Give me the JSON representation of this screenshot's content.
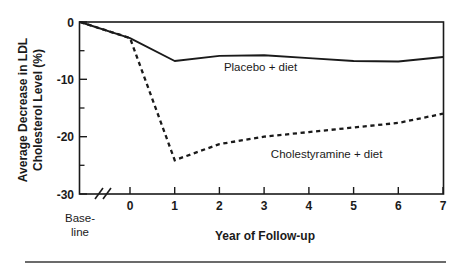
{
  "chart_data": {
    "type": "line",
    "title": "",
    "xlabel": "Year of Follow-up",
    "ylabel": "Average Decrease in LDL Cholesterol Level (%)",
    "ylabel_line1": "Average Decrease in LDL",
    "ylabel_line2": "Cholesterol Level (%)",
    "ylim": [
      -30,
      0
    ],
    "y_ticks": [
      0,
      -10,
      -20,
      -30
    ],
    "y_tick_labels": [
      "0",
      "-10",
      "-20",
      "-30"
    ],
    "y_minor_ticks": [
      -5,
      -15,
      -25
    ],
    "xlim_category": [
      "Baseline",
      0,
      1,
      2,
      3,
      4,
      5,
      6,
      7
    ],
    "x_ticks": [
      0,
      1,
      2,
      3,
      4,
      5,
      6,
      7
    ],
    "x_tick_labels": [
      "0",
      "1",
      "2",
      "3",
      "4",
      "5",
      "6",
      "7"
    ],
    "baseline_tick_label_line1": "Base-",
    "baseline_tick_label_line2": "line",
    "axis_break": true,
    "grid": false,
    "legend": "inline-annotations",
    "series": [
      {
        "name": "Placebo + diet",
        "style": "solid",
        "x": [
          "Baseline",
          0,
          1,
          2,
          3,
          4,
          5,
          6,
          7
        ],
        "values": [
          0,
          -2.8,
          -6.8,
          -5.9,
          -5.8,
          -6.3,
          -6.8,
          -6.9,
          -6.1
        ],
        "label": "Placebo + diet",
        "label_x": 2.1,
        "label_y": -8.5
      },
      {
        "name": "Cholestyramine + diet",
        "style": "dashed",
        "x": [
          "Baseline",
          0,
          1,
          2,
          3,
          4,
          5,
          6,
          7
        ],
        "values": [
          0,
          -2.8,
          -24.1,
          -21.3,
          -20.0,
          -19.2,
          -18.4,
          -17.6,
          -16.0
        ],
        "label": "Cholestyramine + diet",
        "label_x": 3.15,
        "label_y": -23.7
      }
    ],
    "annotations": [
      {
        "text": "Placebo + diet",
        "series": "Placebo + diet"
      },
      {
        "text": "Cholestyramine + diet",
        "series": "Cholestyramine + diet"
      }
    ],
    "colors": {
      "axis": "#1a1a1a",
      "series_placebo": "#1a1a1a",
      "series_cholestyramine": "#1a1a1a",
      "background": "#ffffff"
    }
  }
}
